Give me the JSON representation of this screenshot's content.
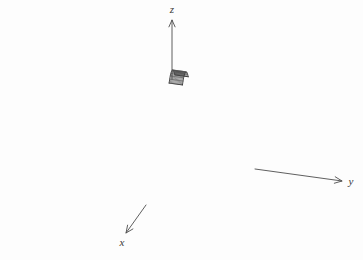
{
  "figure": {
    "kind": "3d-surface-wireframe",
    "background_color": "#fdfdfd",
    "mesh_color": "#4a4a4a",
    "edge_color": "#2b2b2b",
    "axis_color": "#4d4d4d",
    "label_color": "#3a3a3a"
  },
  "axes": {
    "z": {
      "label": "z",
      "label_x": 172,
      "label_y": 13,
      "line": {
        "x1": 172,
        "y1": 79,
        "x2": 172,
        "y2": 20
      },
      "arrow": "up"
    },
    "y": {
      "label": "y",
      "label_x": 351,
      "label_y": 185,
      "line": {
        "x1": 255,
        "y1": 169,
        "x2": 342,
        "y2": 181
      },
      "arrow": "right-down"
    },
    "x": {
      "label": "x",
      "label_x": 122,
      "label_y": 246,
      "line": {
        "x1": 146,
        "y1": 205,
        "x2": 126,
        "y2": 233
      },
      "arrow": "left-down"
    }
  },
  "chart_data": {
    "type": "surface",
    "title": "",
    "xlabel": "x",
    "ylabel": "y",
    "zlabel": "z",
    "surface_equation": "z = 1 - x^2  (parabolic cylinder, constant in y)",
    "u_samples": 11,
    "v_samples": 13,
    "u_range": [
      -1.0,
      1.0
    ],
    "v_range": [
      0.0,
      1.0
    ],
    "z_profile": [
      0.0,
      0.36,
      0.64,
      0.84,
      0.96,
      1.0,
      0.96,
      0.84,
      0.64,
      0.36,
      0.0
    ],
    "projection": {
      "origin_x": 172,
      "origin_y": 79,
      "x_axis_vec": [
        -2.62,
        3.72
      ],
      "y_axis_vec": [
        13.35,
        1.85
      ],
      "z_axis_vec": [
        0.0,
        -8.6
      ],
      "x_scale": 11.0,
      "y_scale": 10.0,
      "z_scale": 10.0
    },
    "grid": true,
    "legend": "none"
  }
}
